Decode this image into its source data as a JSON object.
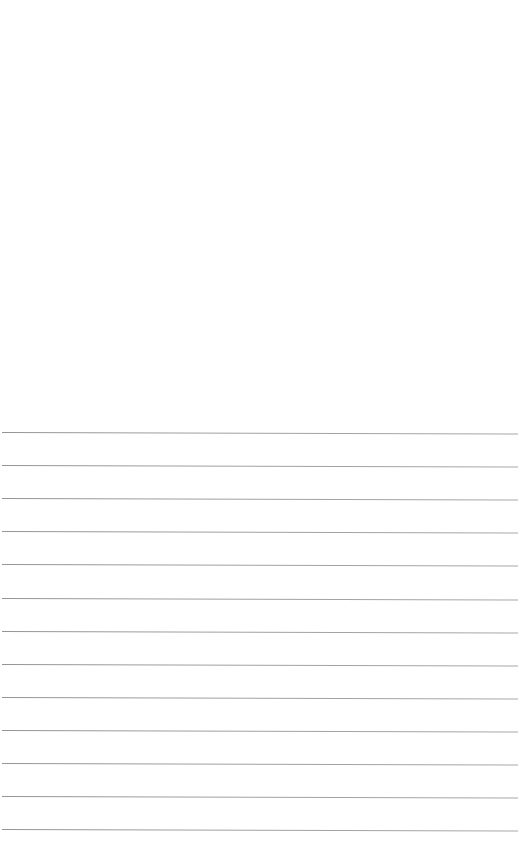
{
  "document": {
    "type": "lined-paper",
    "ruled_line_count": 13,
    "line_color": "#999999",
    "background_color": "#ffffff",
    "text_content": []
  }
}
